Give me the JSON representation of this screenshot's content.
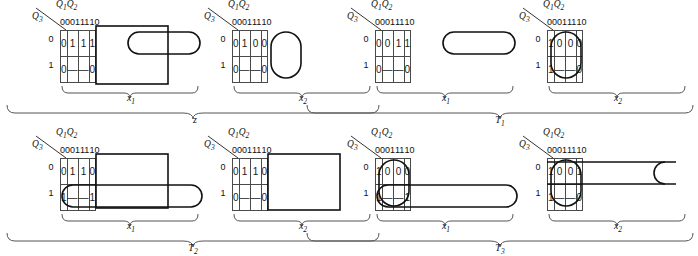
{
  "figure": {
    "type": "karnaugh-maps",
    "column_header_label": "Q1Q2",
    "row_header_label": "Q3",
    "column_headers": [
      "00",
      "01",
      "11",
      "10"
    ],
    "row_headers": [
      "0",
      "1"
    ],
    "dash_symbol": "—"
  },
  "groups": [
    {
      "id": "z",
      "label": "z",
      "label_sub": "",
      "maps": [
        {
          "id": "z-x1",
          "label": "x",
          "label_sub": "1",
          "rows": [
            [
              "0",
              "1",
              "1",
              "1"
            ],
            [
              "0",
              "—",
              "—",
              "0"
            ]
          ]
        },
        {
          "id": "z-x2",
          "label": "x",
          "label_sub": "2",
          "rows": [
            [
              "0",
              "1",
              "0",
              "0"
            ],
            [
              "0",
              "—",
              "—",
              "0"
            ]
          ]
        }
      ]
    },
    {
      "id": "T1",
      "label": "T",
      "label_sub": "1",
      "maps": [
        {
          "id": "T1-x1",
          "label": "x",
          "label_sub": "1",
          "rows": [
            [
              "0",
              "0",
              "1",
              "1"
            ],
            [
              "0",
              "—",
              "—",
              "0"
            ]
          ]
        },
        {
          "id": "T1-x2",
          "label": "x",
          "label_sub": "2",
          "rows": [
            [
              "1",
              "0",
              "0",
              "0"
            ],
            [
              "1",
              "—",
              "—",
              "0"
            ]
          ]
        }
      ]
    },
    {
      "id": "T2",
      "label": "T",
      "label_sub": "2",
      "maps": [
        {
          "id": "T2-x1",
          "label": "x",
          "label_sub": "1",
          "rows": [
            [
              "0",
              "1",
              "1",
              "0"
            ],
            [
              "1",
              "—",
              "—",
              "1"
            ]
          ]
        },
        {
          "id": "T2-x2",
          "label": "x",
          "label_sub": "2",
          "rows": [
            [
              "0",
              "1",
              "1",
              "0"
            ],
            [
              "0",
              "—",
              "—",
              "0"
            ]
          ]
        }
      ]
    },
    {
      "id": "T3",
      "label": "T",
      "label_sub": "3",
      "maps": [
        {
          "id": "T3-x1",
          "label": "x",
          "label_sub": "1",
          "rows": [
            [
              "1",
              "0",
              "0",
              "0"
            ],
            [
              "1",
              "—",
              "—",
              "1"
            ]
          ]
        },
        {
          "id": "T3-x2",
          "label": "x",
          "label_sub": "2",
          "rows": [
            [
              "1",
              "0",
              "0",
              "1"
            ],
            [
              "1",
              "—",
              "—",
              "0"
            ]
          ]
        }
      ]
    }
  ],
  "colors": {
    "ink": "#1a1a1a",
    "grid_line": "#4a4a4a",
    "group_line": "#111111",
    "background": "#ffffff"
  }
}
